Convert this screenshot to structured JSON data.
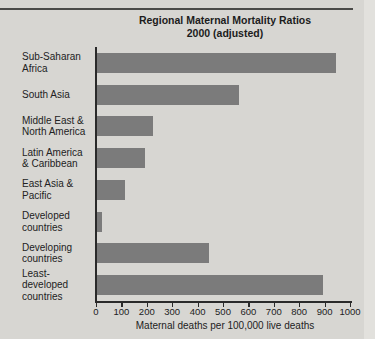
{
  "page": {
    "title_line1": "Regional Maternal Mortality Ratios",
    "title_line2": "2000 (adjusted)"
  },
  "chart_data": {
    "type": "bar",
    "orientation": "horizontal",
    "title": "Regional Maternal Mortality Ratios 2000 (adjusted)",
    "categories": [
      "Sub-Saharan Africa",
      "South Asia",
      "Middle East & North America",
      "Latin America & Caribbean",
      "East Asia & Pacific",
      "Developed countries",
      "Developing countries",
      "Least-developed countries"
    ],
    "category_lines": [
      [
        "Sub-Saharan",
        "Africa"
      ],
      [
        "South Asia"
      ],
      [
        "Middle East &",
        "North America"
      ],
      [
        "Latin America",
        "& Caribbean"
      ],
      [
        "East Asia &",
        "Pacific"
      ],
      [
        "Developed",
        "countries"
      ],
      [
        "Developing",
        "countries"
      ],
      [
        "Least-",
        "developed",
        "countries"
      ]
    ],
    "values": [
      940,
      560,
      220,
      190,
      110,
      20,
      440,
      890
    ],
    "xlabel": "Maternal deaths per 100,000 live deaths",
    "xlim": [
      0,
      1000
    ],
    "xticks": [
      0,
      100,
      200,
      300,
      400,
      500,
      600,
      700,
      800,
      900,
      1000
    ],
    "grid": false,
    "legend": false,
    "bar_color": "#7b7b7b",
    "background_color": "#d7d6d2",
    "axis_color": "#2a2a2a"
  }
}
